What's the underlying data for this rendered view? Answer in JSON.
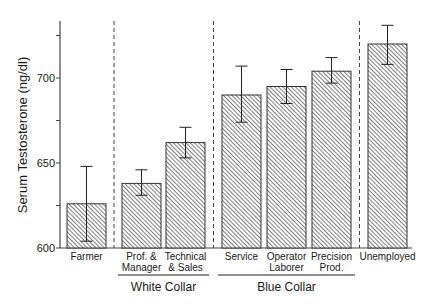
{
  "chart_data": {
    "type": "bar",
    "title": "",
    "xlabel": "",
    "ylabel": "Serum Testosterone (ng/dl)",
    "ylim": [
      600,
      735
    ],
    "yticks": [
      600,
      625,
      650,
      675,
      700,
      725
    ],
    "ytick_labels": [
      "600",
      "",
      "650",
      "",
      "700",
      ""
    ],
    "grid": false,
    "legend": null,
    "pattern": "diagonal-hatch",
    "categories": [
      {
        "label": [
          "Farmer"
        ],
        "value": 626,
        "err_low": 604,
        "err_high": 648
      },
      {
        "label": [
          "Prof. &",
          "Manager"
        ],
        "value": 638,
        "err_low": 631,
        "err_high": 646
      },
      {
        "label": [
          "Technical",
          "& Sales"
        ],
        "value": 662,
        "err_low": 653,
        "err_high": 671
      },
      {
        "label": [
          "Service"
        ],
        "value": 690,
        "err_low": 674,
        "err_high": 707
      },
      {
        "label": [
          "Operator",
          "Laborer"
        ],
        "value": 695,
        "err_low": 685,
        "err_high": 705
      },
      {
        "label": [
          "Precision",
          "Prod."
        ],
        "value": 704,
        "err_low": 697,
        "err_high": 712
      },
      {
        "label": [
          "Unemployed"
        ],
        "value": 720,
        "err_low": 708,
        "err_high": 731
      }
    ],
    "groups": [
      {
        "name": "White Collar",
        "from": 1,
        "to": 2
      },
      {
        "name": "Blue Collar",
        "from": 3,
        "to": 5
      }
    ],
    "dividers_after": [
      0,
      2,
      5
    ]
  },
  "colors": {
    "axis": "#444444",
    "bar_fill": "#ffffff",
    "hatch": "#555555",
    "bar_edge": "#333333",
    "text": "#1a1a1a"
  }
}
